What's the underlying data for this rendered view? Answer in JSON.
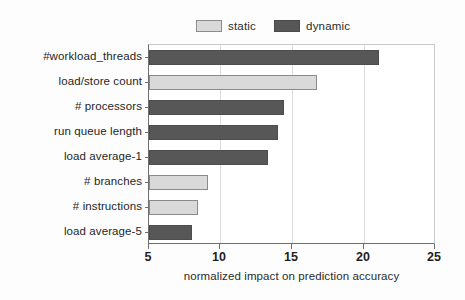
{
  "chart_data": {
    "type": "bar",
    "orientation": "horizontal",
    "title": "",
    "xlabel": "normalized impact on prediction accuracy",
    "ylabel": "",
    "xlim": [
      5,
      25
    ],
    "xticks": [
      5,
      10,
      15,
      20,
      25
    ],
    "xticklabels": [
      "5",
      "10",
      "15",
      "20",
      "25"
    ],
    "grid": "vertical",
    "legend": {
      "position": "top-center",
      "entries": [
        {
          "label": "static",
          "color": "#d9d9d9",
          "swatch": "static-swatch"
        },
        {
          "label": "dynamic",
          "color": "#575757",
          "swatch": "dynamic-swatch"
        }
      ]
    },
    "categories": [
      "#workload_threads",
      "load/store count",
      "# processors",
      "run queue length",
      "load average-1",
      "# branches",
      "# instructions",
      "load average-5"
    ],
    "values": [
      21.0,
      16.7,
      14.4,
      14.0,
      13.3,
      9.1,
      8.4,
      8.0
    ],
    "series_of": [
      "dynamic",
      "static",
      "dynamic",
      "dynamic",
      "dynamic",
      "static",
      "static",
      "dynamic"
    ],
    "bars": [
      {
        "category": "#workload_threads",
        "value": 21.0,
        "series": "dynamic"
      },
      {
        "category": "load/store count",
        "value": 16.7,
        "series": "static"
      },
      {
        "category": "# processors",
        "value": 14.4,
        "series": "dynamic"
      },
      {
        "category": "run queue length",
        "value": 14.0,
        "series": "dynamic"
      },
      {
        "category": "load average-1",
        "value": 13.3,
        "series": "dynamic"
      },
      {
        "category": "# branches",
        "value": 9.1,
        "series": "static"
      },
      {
        "category": "# instructions",
        "value": 8.4,
        "series": "static"
      },
      {
        "category": "load average-5",
        "value": 8.0,
        "series": "dynamic"
      }
    ],
    "series": [
      {
        "name": "static",
        "color": "#d9d9d9"
      },
      {
        "name": "dynamic",
        "color": "#575757"
      }
    ]
  }
}
